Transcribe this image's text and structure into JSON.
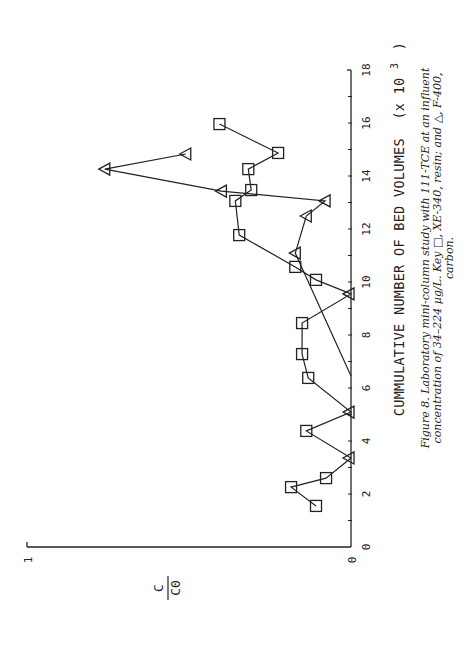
{
  "chart_data": {
    "type": "line",
    "orientation_note": "figure printed rotated 90 degrees counter-clockwise",
    "xlabel": "CUMMULATIVE NUMBER OF BED VOLUMES",
    "xlabel_units": "(x 10",
    "xlabel_exp": "3",
    "xlabel_close": ")",
    "ylabel_num": "C",
    "ylabel_den": "C0",
    "xlim": [
      0,
      18
    ],
    "ylim": [
      0,
      1
    ],
    "x_ticks": [
      0,
      2,
      4,
      6,
      8,
      10,
      12,
      14,
      16,
      18
    ],
    "x_tick_labels": [
      "0",
      "2",
      "4",
      "6",
      "8",
      "10",
      "12",
      "14",
      "16",
      "18"
    ],
    "y_tick_labels": [
      "0",
      "1"
    ],
    "grid": false,
    "series": [
      {
        "name": "XE-340, resin",
        "marker": "square",
        "points": [
          [
            1.55,
            0.108
          ],
          [
            2.26,
            0.185
          ],
          [
            2.6,
            0.077
          ],
          [
            3.36,
            0.0
          ],
          [
            4.38,
            0.138
          ],
          [
            5.09,
            0.0
          ],
          [
            6.38,
            0.132
          ],
          [
            7.28,
            0.151
          ],
          [
            8.45,
            0.151
          ],
          [
            9.55,
            0.0
          ],
          [
            10.08,
            0.108
          ],
          [
            10.57,
            0.172
          ],
          [
            11.77,
            0.345
          ],
          [
            13.06,
            0.357
          ],
          [
            13.47,
            0.308
          ],
          [
            14.26,
            0.317
          ],
          [
            14.87,
            0.225
          ],
          [
            15.96,
            0.406
          ]
        ],
        "zero_markers": "triangle"
      },
      {
        "name": "F-400, carbon",
        "marker": "triangle",
        "points": [
          [
            6.45,
            0.0
          ],
          [
            11.09,
            0.172
          ],
          [
            12.49,
            0.138
          ],
          [
            13.06,
            0.08
          ],
          [
            13.43,
            0.4
          ],
          [
            14.26,
            0.76
          ],
          [
            14.83,
            0.51
          ]
        ]
      }
    ]
  },
  "caption": {
    "line1": "Figure 8. Laboratory mini-column study with 111-TCE at an influent",
    "line2": "concentration of 34–224 µg/L. Key □, XE-340, resin; and △, F-400,",
    "line3": "carbon."
  }
}
